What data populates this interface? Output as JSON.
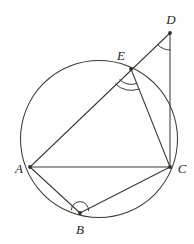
{
  "figure": {
    "type": "euclidean-geometry-diagram",
    "canvas": {
      "width": 194,
      "height": 244,
      "background": "#fefefe"
    },
    "stroke_color": "#3b3b33",
    "label_color": "#262622"
  },
  "circle": {
    "name": "circumscribed-circle",
    "cx": 99,
    "cy": 139,
    "r": 78.5
  },
  "points": [
    {
      "id": "A",
      "label": "A",
      "x": 30,
      "y": 167,
      "label_x": 19,
      "label_y": 170,
      "on_circle": true,
      "dot": true
    },
    {
      "id": "B",
      "label": "B",
      "x": 80,
      "y": 213,
      "label_x": 80,
      "label_y": 231,
      "on_circle": true,
      "dot": true
    },
    {
      "id": "C",
      "label": "C",
      "x": 170,
      "y": 167,
      "label_x": 182,
      "label_y": 170,
      "on_circle": true,
      "dot": true
    },
    {
      "id": "D",
      "label": "D",
      "x": 170,
      "y": 33,
      "label_x": 171,
      "label_y": 21,
      "on_circle": false,
      "dot": true
    },
    {
      "id": "E",
      "label": "E",
      "x": 131,
      "y": 69,
      "label_x": 121,
      "label_y": 57,
      "on_circle": true,
      "dot": true
    }
  ],
  "segments": [
    {
      "id": "AD",
      "from": "A",
      "to": "D",
      "note": "chord AE extended through E to D"
    },
    {
      "id": "AC",
      "from": "A",
      "to": "C",
      "note": "horizontal chord"
    },
    {
      "id": "AB",
      "from": "A",
      "to": "B",
      "note": "chord"
    },
    {
      "id": "BC",
      "from": "B",
      "to": "C",
      "note": "chord"
    },
    {
      "id": "EC",
      "from": "E",
      "to": "C",
      "note": "chord"
    },
    {
      "id": "DC",
      "from": "D",
      "to": "C",
      "note": "near-vertical secant"
    }
  ],
  "angle_marks": [
    {
      "id": "angle-D",
      "at": "D",
      "arcs": 1,
      "note": "single arc at vertex D between DA and DC"
    },
    {
      "id": "angle-E",
      "at": "E",
      "arcs": 2,
      "note": "double arc at vertex E between EC and ED-side"
    },
    {
      "id": "angle-B",
      "at": "B",
      "arcs": 1,
      "note": "single arc at vertex B between BA and BC"
    }
  ],
  "chart_data": {
    "type": "diagram",
    "shapes": [
      "circle",
      "triangle-ADC",
      "quadrilateral-ABCE"
    ],
    "labels": [
      "A",
      "B",
      "C",
      "D",
      "E"
    ]
  }
}
